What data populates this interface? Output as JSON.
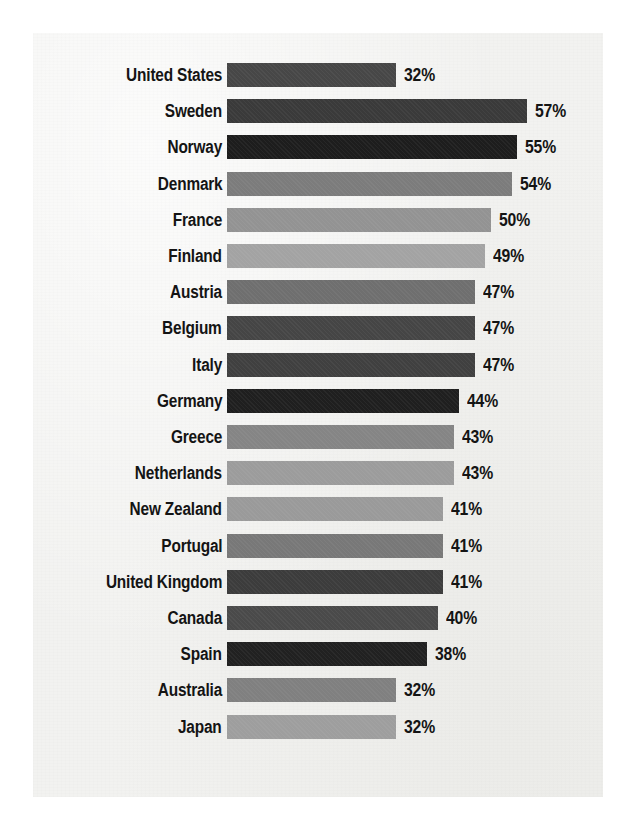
{
  "figure": {
    "kind": "horizontal-bar-chart",
    "background_color": "#ffffff",
    "paper_color": "#f2f2f0",
    "text_color": "#141414",
    "value_suffix": "%"
  },
  "chart_data": {
    "type": "bar",
    "orientation": "horizontal",
    "title": "",
    "subtitle": "",
    "xlabel": "",
    "ylabel": "",
    "xlim": [
      0,
      60
    ],
    "grid": false,
    "legend": null,
    "value_format": "{v}%",
    "categories": [
      "United States",
      "Sweden",
      "Norway",
      "Denmark",
      "France",
      "Finland",
      "Austria",
      "Belgium",
      "Italy",
      "Germany",
      "Greece",
      "Netherlands",
      "New Zealand",
      "Portugal",
      "United Kingdom",
      "Canada",
      "Spain",
      "Australia",
      "Japan"
    ],
    "values": [
      32,
      57,
      55,
      54,
      50,
      49,
      47,
      47,
      47,
      44,
      43,
      43,
      41,
      41,
      41,
      40,
      38,
      32,
      32
    ],
    "value_labels": [
      "32%",
      "57%",
      "55%",
      "54%",
      "50%",
      "49%",
      "47%",
      "47%",
      "47%",
      "44%",
      "43%",
      "43%",
      "41%",
      "41%",
      "41%",
      "40%",
      "38%",
      "32%",
      "32%"
    ],
    "bar_colors": [
      "#474747",
      "#3a3a3a",
      "#1d1d1d",
      "#7c7c7c",
      "#939393",
      "#a3a3a3",
      "#6f6f6f",
      "#454545",
      "#404040",
      "#1f1f1f",
      "#858585",
      "#9c9c9c",
      "#9a9a9a",
      "#787878",
      "#3c3c3c",
      "#4a4a4a",
      "#212121",
      "#808080",
      "#9e9e9e"
    ],
    "rows": [
      {
        "label": "United States",
        "value": 32,
        "value_label": "32%",
        "color": "#474747"
      },
      {
        "label": "Sweden",
        "value": 57,
        "value_label": "57%",
        "color": "#3a3a3a"
      },
      {
        "label": "Norway",
        "value": 55,
        "value_label": "55%",
        "color": "#1d1d1d"
      },
      {
        "label": "Denmark",
        "value": 54,
        "value_label": "54%",
        "color": "#7c7c7c"
      },
      {
        "label": "France",
        "value": 50,
        "value_label": "50%",
        "color": "#939393"
      },
      {
        "label": "Finland",
        "value": 49,
        "value_label": "49%",
        "color": "#a3a3a3"
      },
      {
        "label": "Austria",
        "value": 47,
        "value_label": "47%",
        "color": "#6f6f6f"
      },
      {
        "label": "Belgium",
        "value": 47,
        "value_label": "47%",
        "color": "#454545"
      },
      {
        "label": "Italy",
        "value": 47,
        "value_label": "47%",
        "color": "#404040"
      },
      {
        "label": "Germany",
        "value": 44,
        "value_label": "44%",
        "color": "#1f1f1f"
      },
      {
        "label": "Greece",
        "value": 43,
        "value_label": "43%",
        "color": "#858585"
      },
      {
        "label": "Netherlands",
        "value": 43,
        "value_label": "43%",
        "color": "#9c9c9c"
      },
      {
        "label": "New Zealand",
        "value": 41,
        "value_label": "41%",
        "color": "#9a9a9a"
      },
      {
        "label": "Portugal",
        "value": 41,
        "value_label": "41%",
        "color": "#787878"
      },
      {
        "label": "United Kingdom",
        "value": 41,
        "value_label": "41%",
        "color": "#3c3c3c"
      },
      {
        "label": "Canada",
        "value": 40,
        "value_label": "40%",
        "color": "#4a4a4a"
      },
      {
        "label": "Spain",
        "value": 38,
        "value_label": "38%",
        "color": "#212121"
      },
      {
        "label": "Australia",
        "value": 32,
        "value_label": "32%",
        "color": "#808080"
      },
      {
        "label": "Japan",
        "value": 32,
        "value_label": "32%",
        "color": "#9e9e9e"
      }
    ]
  },
  "layout": {
    "bar_origin_x": 227,
    "px_per_unit": 5.27,
    "first_row_top": 62,
    "row_pitch": 36.2,
    "bar_height": 24,
    "value_gap": 8
  }
}
